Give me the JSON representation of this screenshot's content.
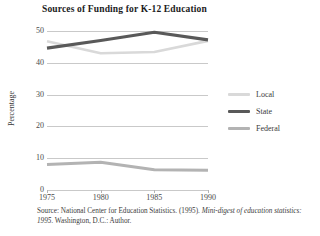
{
  "chart_data": {
    "type": "line",
    "title": "Sources of Funding for K-12 Education",
    "xlabel": "",
    "ylabel": "Percentage",
    "x": [
      1975,
      1980,
      1985,
      1990
    ],
    "categories": [
      "1975",
      "1980",
      "1985",
      "1990"
    ],
    "series": [
      {
        "name": "Local",
        "values": [
          46.8,
          43.0,
          43.4,
          46.9
        ],
        "color": "#d9d9d9",
        "width": 2.6
      },
      {
        "name": "State",
        "values": [
          44.6,
          47.0,
          49.6,
          47.2
        ],
        "color": "#595959",
        "width": 3.2
      },
      {
        "name": "Federal",
        "values": [
          8.0,
          8.7,
          6.4,
          6.2
        ],
        "color": "#b3b3b3",
        "width": 3.0
      }
    ],
    "ylim": [
      0,
      50
    ],
    "yticks": [
      0,
      10,
      20,
      30,
      40,
      50
    ],
    "ytick_labels": [
      "0",
      "10",
      "20",
      "30",
      "40",
      "50"
    ],
    "xtick_labels": [
      "1975",
      "1980",
      "1985",
      "1990"
    ],
    "grid": "horizontal",
    "legend_position": "right"
  },
  "legend": {
    "entries": [
      {
        "label": "Local"
      },
      {
        "label": "State"
      },
      {
        "label": "Federal"
      }
    ]
  },
  "source_note": {
    "line1_plain": "Source: National Center for Education Statistics. (1995). ",
    "line1_italic": "Mini-digest of",
    "line2_italic": "education statistics: 1995.",
    "line2_plain": " Washington, D.C.: Author."
  }
}
